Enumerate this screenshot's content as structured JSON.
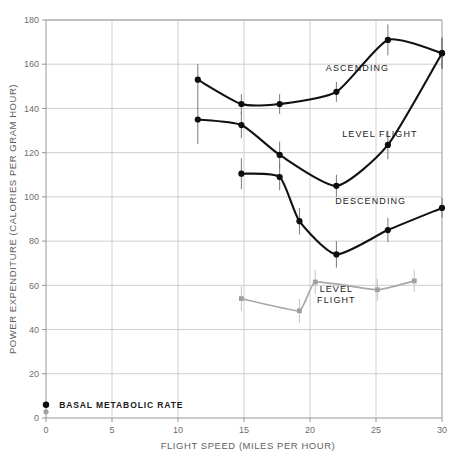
{
  "chart_data": {
    "type": "line",
    "title": "",
    "xlabel": "FLIGHT SPEED (MILES PER HOUR)",
    "ylabel": "POWER EXPENDITURE (CALORIES PER GRAM HOUR)",
    "xlim": [
      0,
      30
    ],
    "ylim": [
      0,
      180
    ],
    "xticks": [
      0,
      5,
      10,
      15,
      20,
      25,
      30
    ],
    "xtick_labels": [
      "0",
      "5",
      "10",
      "15",
      "20",
      "25",
      "30"
    ],
    "yticks": [
      0,
      20,
      40,
      60,
      80,
      100,
      120,
      140,
      160,
      180
    ],
    "ytick_labels": [
      "0",
      "20",
      "40",
      "60",
      "80",
      "100",
      "120",
      "140",
      "160",
      "180"
    ],
    "grid": true,
    "legend_position": "inline-annotations",
    "series": [
      {
        "name": "ASCENDING",
        "color": "#111111",
        "marker": "filled-circle",
        "label_x": 23.6,
        "label_y": 157,
        "x": [
          11.5,
          14.8,
          17.7,
          22.0,
          25.9,
          30.0
        ],
        "y": [
          153.0,
          142.0,
          142.0,
          147.5,
          171.0,
          165.0
        ],
        "yerr": [
          7.0,
          4.5,
          4.5,
          4.5,
          7.0,
          7.0
        ]
      },
      {
        "name": "LEVEL FLIGHT",
        "color": "#111111",
        "marker": "filled-circle",
        "label_x": 25.3,
        "label_y": 127,
        "x": [
          11.5,
          14.8,
          17.7,
          22.0,
          25.9,
          30.0
        ],
        "y": [
          135.0,
          132.5,
          119.0,
          105.0,
          123.5,
          165.0
        ],
        "yerr": [
          11.0,
          6.0,
          6.0,
          5.0,
          6.5,
          7.0
        ]
      },
      {
        "name": "DESCENDING",
        "color": "#111111",
        "marker": "filled-circle",
        "label_x": 24.6,
        "label_y": 97,
        "x": [
          14.8,
          17.7,
          19.2,
          22.0,
          25.9,
          30.0
        ],
        "y": [
          110.5,
          109.0,
          89.0,
          74.0,
          85.0,
          95.0
        ],
        "yerr": [
          7.0,
          6.0,
          6.0,
          6.0,
          5.5,
          4.5
        ]
      },
      {
        "name": "LEVEL FLIGHT",
        "color": "#a8a8a8",
        "marker": "filled-square-gray",
        "label_x": 22.0,
        "label_y": 57,
        "label_lines": [
          "LEVEL",
          "FLIGHT"
        ],
        "x": [
          14.8,
          19.2,
          20.4,
          25.1,
          27.9
        ],
        "y": [
          54.0,
          48.5,
          61.5,
          58.0,
          62.0
        ],
        "yerr": [
          5.5,
          5.5,
          5.5,
          5.0,
          5.0
        ]
      }
    ],
    "annotations": [
      {
        "name": "BASAL METABOLIC RATE",
        "text": "BASAL METABOLIC RATE",
        "points": [
          {
            "x": 0,
            "y": 6.0,
            "color": "#0d0d0d"
          },
          {
            "x": 0,
            "y": 2.8,
            "color": "#a0a0a0"
          }
        ],
        "label_x": 1.0,
        "label_y": 6.0
      }
    ]
  }
}
